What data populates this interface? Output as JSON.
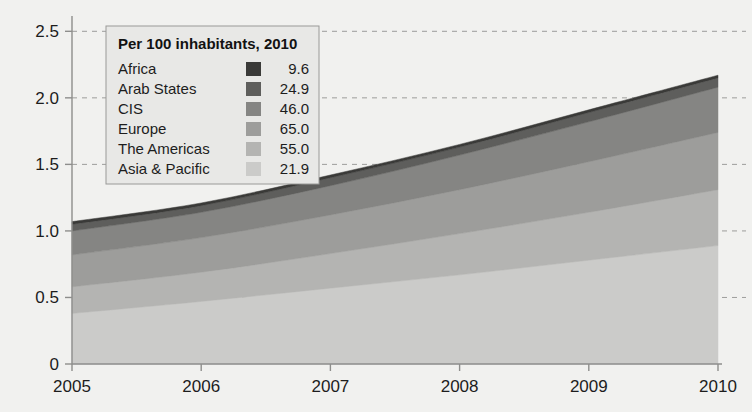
{
  "chart_data": {
    "type": "area",
    "stacked": true,
    "title": "",
    "subtitle": "",
    "xlabel": "",
    "ylabel": "",
    "x": [
      2005,
      2006,
      2007,
      2008,
      2009,
      2010
    ],
    "xtick_labels": [
      "2005",
      "2006",
      "2007",
      "2008",
      "2009",
      "2010"
    ],
    "xlim": [
      2005,
      2010
    ],
    "ylim": [
      0,
      2.6
    ],
    "yticks": [
      0,
      0.5,
      1.0,
      1.5,
      2.0,
      2.5
    ],
    "ytick_labels": [
      "0",
      "0.5",
      "1.0",
      "1.5",
      "2.0",
      "2.5"
    ],
    "grid": true,
    "grid_style": "dashed-horizontal",
    "legend_position": "top-left-inside",
    "series": [
      {
        "name": "Asia & Pacific",
        "value_2010": "21.9",
        "color": "#cbcbc9",
        "values": [
          0.38,
          0.47,
          0.57,
          0.67,
          0.78,
          0.89
        ]
      },
      {
        "name": "The Americas",
        "value_2010": "55.0",
        "color": "#b4b4b2",
        "values": [
          0.2,
          0.22,
          0.26,
          0.31,
          0.36,
          0.42
        ]
      },
      {
        "name": "Europe",
        "value_2010": "65.0",
        "color": "#9d9d9b",
        "values": [
          0.24,
          0.26,
          0.29,
          0.33,
          0.38,
          0.43
        ]
      },
      {
        "name": "CIS",
        "value_2010": "46.0",
        "color": "#858583",
        "values": [
          0.18,
          0.19,
          0.22,
          0.26,
          0.3,
          0.34
        ]
      },
      {
        "name": "Arab States",
        "value_2010": "24.9",
        "color": "#5e5e5c",
        "values": [
          0.05,
          0.05,
          0.06,
          0.06,
          0.07,
          0.07
        ]
      },
      {
        "name": "Africa",
        "value_2010": "9.6",
        "color": "#3a3a38",
        "values": [
          0.02,
          0.02,
          0.02,
          0.02,
          0.02,
          0.02
        ]
      }
    ],
    "totals": [
      1.07,
      1.21,
      1.42,
      1.65,
      1.91,
      2.17
    ]
  },
  "legend": {
    "title": "Per 100 inhabitants, 2010",
    "entries": [
      {
        "label": "Africa",
        "value": "9.6",
        "color": "#3a3a38"
      },
      {
        "label": "Arab States",
        "value": "24.9",
        "color": "#5e5e5c"
      },
      {
        "label": "CIS",
        "value": "46.0",
        "color": "#858583"
      },
      {
        "label": "Europe",
        "value": "65.0",
        "color": "#9d9d9b"
      },
      {
        "label": "The Americas",
        "value": "55.0",
        "color": "#b4b4b2"
      },
      {
        "label": "Asia & Pacific",
        "value": "21.9",
        "color": "#cbcbc9"
      }
    ]
  },
  "colors": {
    "background": "#f1f1ef",
    "axis": "#8e8e8c",
    "grid": "#9d9d9b",
    "text": "#1d1d1d"
  }
}
